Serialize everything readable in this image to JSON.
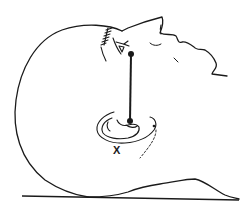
{
  "diagram": {
    "elements": [
      {
        "name": "head-outline",
        "description": "outline of skull and face in profile"
      },
      {
        "name": "eye",
        "description": "eye with lateral canthus marked"
      },
      {
        "name": "eye-landmark-dot",
        "description": "dot at lateral canthus of eye"
      },
      {
        "name": "ear",
        "description": "external ear"
      },
      {
        "name": "ear-landmark-dot",
        "description": "dot at tragus of ear"
      },
      {
        "name": "canthus-tragus-line",
        "description": "vertical line connecting eye dot to ear dot"
      },
      {
        "name": "surface-line",
        "description": "flat surface the head rests on"
      }
    ],
    "marker_label": "X",
    "colors": {
      "line": "#1a1a1a",
      "background": "#ffffff"
    }
  }
}
